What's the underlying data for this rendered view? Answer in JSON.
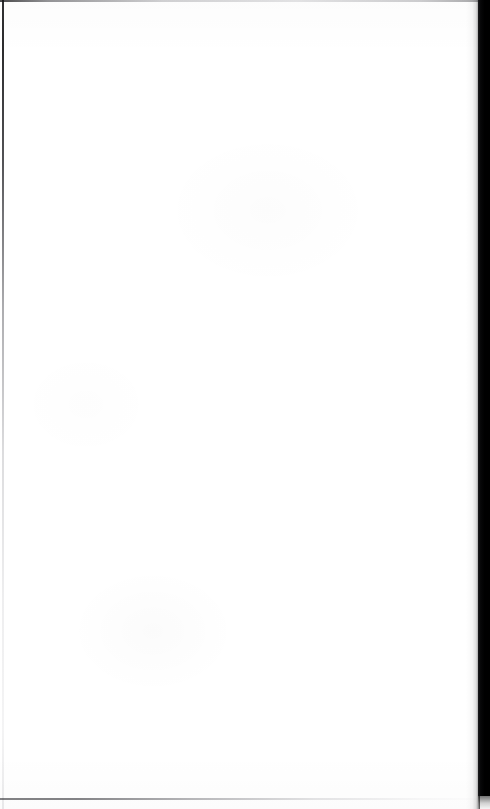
{
  "document": {
    "type": "scanned-page",
    "page_label": "",
    "body_text": "",
    "header_text": "",
    "footer_text": "",
    "is_blank": true
  },
  "colors": {
    "page_background": "#ffffff",
    "gutter_band": "#000000",
    "edge_line": "#1a1a1a",
    "bottom_edge_line": "#38383c"
  },
  "regions": {
    "top_edge_label": "",
    "left_edge_label": "",
    "bottom_edge_label": "",
    "gutter_label": ""
  }
}
